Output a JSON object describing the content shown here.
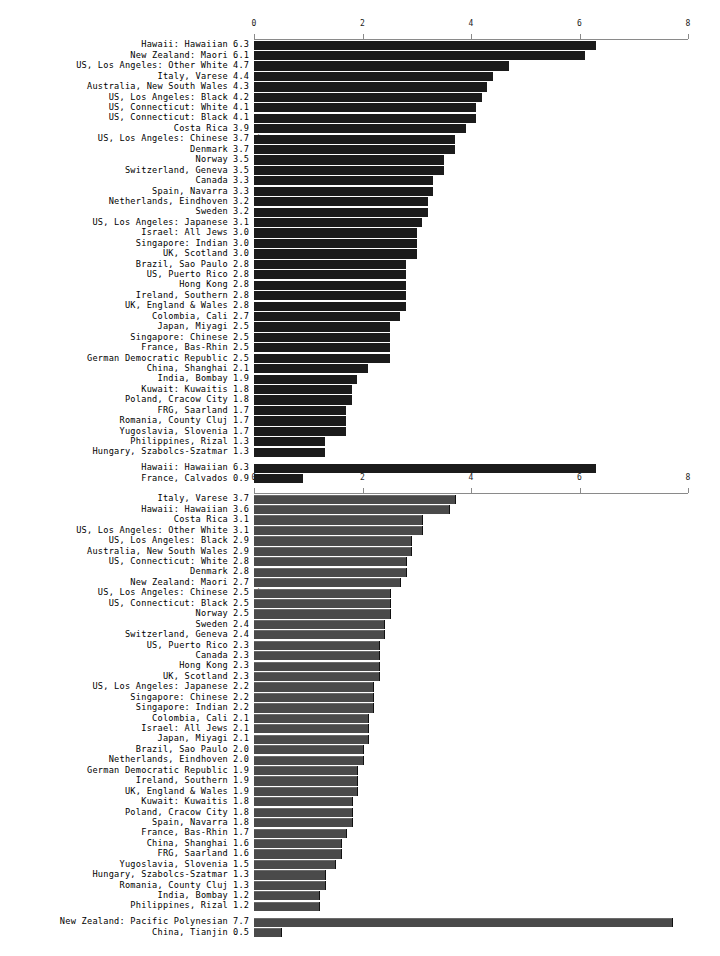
{
  "chart_data": [
    {
      "type": "bar",
      "orientation": "horizontal",
      "id": "top",
      "title": "",
      "xlabel": "",
      "ylabel": "",
      "xlim": [
        0,
        8
      ],
      "xticks": [
        0,
        2,
        4,
        6,
        8
      ],
      "xtick_labels": [
        "0",
        "2",
        "4",
        "6",
        "8"
      ],
      "grid": false,
      "bar_color": "#1b1b1b",
      "axis_color": "#8a8a8a",
      "categories": [
        "Hawaii: Hawaiian",
        "New Zealand: Maori",
        "US, Los Angeles: Other White",
        "Italy, Varese",
        "Australia, New South Wales",
        "US, Los Angeles: Black",
        "US, Connecticut: White",
        "US, Connecticut: Black",
        "Costa Rica",
        "US, Los Angeles: Chinese",
        "Denmark",
        "Norway",
        "Switzerland, Geneva",
        "Canada",
        "Spain, Navarra",
        "Netherlands, Eindhoven",
        "Sweden",
        "US, Los Angeles: Japanese",
        "Israel: All Jews",
        "Singapore: Indian",
        "UK, Scotland",
        "Brazil, Sao Paulo",
        "US, Puerto Rico",
        "Hong Kong",
        "Ireland, Southern",
        "UK, England & Wales",
        "Colombia, Cali",
        "Japan, Miyagi",
        "Singapore: Chinese",
        "France, Bas-Rhin",
        "German Democratic Republic",
        "China, Shanghai",
        "India, Bombay",
        "Kuwait: Kuwaitis",
        "Poland, Cracow City",
        "FRG, Saarland",
        "Romania, County Cluj",
        "Yugoslavia, Slovenia",
        "Philippines, Rizal",
        "Hungary, Szabolcs-Szatmar",
        "Hawaii: Hawaiian",
        "France, Calvados"
      ],
      "values": [
        6.3,
        6.1,
        4.7,
        4.4,
        4.3,
        4.2,
        4.1,
        4.1,
        3.9,
        3.7,
        3.7,
        3.5,
        3.5,
        3.3,
        3.3,
        3.2,
        3.2,
        3.1,
        3.0,
        3.0,
        3.0,
        2.8,
        2.8,
        2.8,
        2.8,
        2.8,
        2.7,
        2.5,
        2.5,
        2.5,
        2.5,
        2.1,
        1.9,
        1.8,
        1.8,
        1.7,
        1.7,
        1.7,
        1.3,
        1.3,
        6.3,
        0.9
      ],
      "value_labels": [
        "6.3",
        "6.1",
        "4.7",
        "4.4",
        "4.3",
        "4.2",
        "4.1",
        "4.1",
        "3.9",
        "3.7",
        "3.7",
        "3.5",
        "3.5",
        "3.3",
        "3.3",
        "3.2",
        "3.2",
        "3.1",
        "3.0",
        "3.0",
        "3.0",
        "2.8",
        "2.8",
        "2.8",
        "2.8",
        "2.8",
        "2.7",
        "2.5",
        "2.5",
        "2.5",
        "2.5",
        "2.1",
        "1.9",
        "1.8",
        "1.8",
        "1.7",
        "1.7",
        "1.7",
        "1.3",
        "1.3",
        "6.3",
        "0.9"
      ],
      "annotations": [
        {
          "index": 9,
          "marker": "*"
        }
      ],
      "group_break_before_index": 40
    },
    {
      "type": "bar",
      "orientation": "horizontal",
      "id": "bottom",
      "title": "",
      "xlabel": "",
      "ylabel": "",
      "xlim": [
        0,
        8
      ],
      "xticks": [
        0,
        2,
        4,
        6,
        8
      ],
      "xtick_labels": [
        "0",
        "2",
        "4",
        "6",
        "8"
      ],
      "grid": false,
      "bar_color": "#4a4a4a",
      "axis_color": "#8a8a8a",
      "categories": [
        "Italy, Varese",
        "Hawaii: Hawaiian",
        "Costa Rica",
        "US, Los Angeles: Other White",
        "US, Los Angeles: Black",
        "Australia, New South Wales",
        "US, Connecticut: White",
        "Denmark",
        "New Zealand: Maori",
        "US, Los Angeles: Chinese",
        "US, Connecticut: Black",
        "Norway",
        "Sweden",
        "Switzerland, Geneva",
        "US, Puerto Rico",
        "Canada",
        "Hong Kong",
        "UK, Scotland",
        "US, Los Angeles: Japanese",
        "Singapore: Chinese",
        "Singapore: Indian",
        "Colombia, Cali",
        "Israel: All Jews",
        "Japan, Miyagi",
        "Brazil, Sao Paulo",
        "Netherlands, Eindhoven",
        "German Democratic Republic",
        "Ireland, Southern",
        "UK, England & Wales",
        "Kuwait: Kuwaitis",
        "Poland, Cracow City",
        "Spain, Navarra",
        "France, Bas-Rhin",
        "China, Shanghai",
        "FRG, Saarland",
        "Yugoslavia, Slovenia",
        "Hungary, Szabolcs-Szatmar",
        "Romania, County Cluj",
        "India, Bombay",
        "Philippines, Rizal",
        "New Zealand: Pacific Polynesian",
        "China, Tianjin"
      ],
      "values": [
        3.7,
        3.6,
        3.1,
        3.1,
        2.9,
        2.9,
        2.8,
        2.8,
        2.7,
        2.5,
        2.5,
        2.5,
        2.4,
        2.4,
        2.3,
        2.3,
        2.3,
        2.3,
        2.2,
        2.2,
        2.2,
        2.1,
        2.1,
        2.1,
        2.0,
        2.0,
        1.9,
        1.9,
        1.9,
        1.8,
        1.8,
        1.8,
        1.7,
        1.6,
        1.6,
        1.5,
        1.3,
        1.3,
        1.2,
        1.2,
        7.7,
        0.5
      ],
      "value_labels": [
        "3.7",
        "3.6",
        "3.1",
        "3.1",
        "2.9",
        "2.9",
        "2.8",
        "2.8",
        "2.7",
        "2.5",
        "2.5",
        "2.5",
        "2.4",
        "2.4",
        "2.3",
        "2.3",
        "2.3",
        "2.3",
        "2.2",
        "2.2",
        "2.2",
        "2.1",
        "2.1",
        "2.1",
        "2.0",
        "2.0",
        "1.9",
        "1.9",
        "1.9",
        "1.8",
        "1.8",
        "1.8",
        "1.7",
        "1.6",
        "1.6",
        "1.5",
        "1.3",
        "1.3",
        "1.2",
        "1.2",
        "7.7",
        "0.5"
      ],
      "annotations": [
        {
          "index": 9,
          "marker": "*"
        },
        {
          "index": 18,
          "marker": "*"
        },
        {
          "index": 20,
          "marker": "*"
        }
      ],
      "group_break_before_index": 40
    }
  ]
}
